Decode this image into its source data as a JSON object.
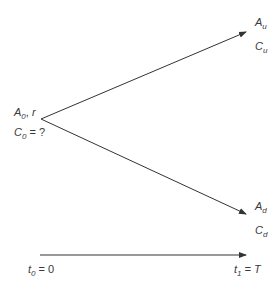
{
  "diagram": {
    "type": "binomial tree (one-period)",
    "nodes": {
      "root": {
        "asset": "A",
        "asset_sub": "0",
        "rate": "r",
        "claim": "C",
        "claim_sub": "0",
        "claim_value": "= ?"
      },
      "up": {
        "asset": "A",
        "asset_sub": "u",
        "claim": "C",
        "claim_sub": "u"
      },
      "down": {
        "asset": "A",
        "asset_sub": "d",
        "claim": "C",
        "claim_sub": "d"
      }
    },
    "time_axis": {
      "start": {
        "var": "t",
        "sub": "0",
        "eq": "= 0"
      },
      "end": {
        "var": "t",
        "sub": "1",
        "eq": "= T"
      }
    },
    "colors": {
      "line": "#333333",
      "text": "#3a3a3a"
    }
  }
}
